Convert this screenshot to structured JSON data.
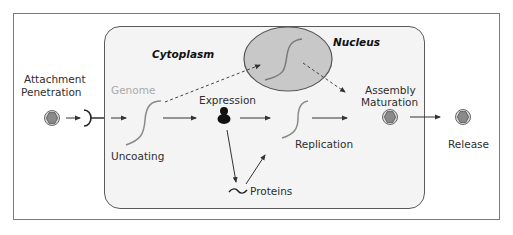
{
  "diagram": {
    "type": "viral-replication-cycle",
    "regions": {
      "cytoplasm": "Cytoplasm",
      "nucleus": "Nucleus"
    },
    "steps": {
      "attachment": "Attachment",
      "penetration": "Penetration",
      "genome": "Genome",
      "uncoating": "Uncoating",
      "expression": "Expression",
      "proteins": "Proteins",
      "replication": "Replication",
      "assembly": "Assembly",
      "maturation": "Maturation",
      "release": "Release"
    },
    "icons": {
      "virion": "hexagonal-capsid-icon",
      "receptor": "receptor-icon",
      "genome": "nucleic-acid-strand-icon",
      "ribosome": "ribosome-icon",
      "protein": "protein-wave-icon"
    },
    "colors": {
      "frame_border": "#7a7a7a",
      "cell_fill": "#f4f4f4",
      "nucleus_fill": "#c8c8c8",
      "virion_fill": "#8a8a8a",
      "genome_line": "#8a8a8a",
      "arrow": "#333333"
    }
  }
}
